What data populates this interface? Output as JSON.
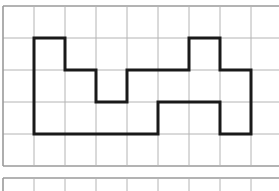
{
  "figure": {
    "colors": {
      "background": "#ffffff",
      "grid_line": "#b4b4b4",
      "grid_border": "#9a9a9a",
      "shape_outline": "#1a1a1a"
    },
    "grid": {
      "origin_x": 3,
      "origin_y": 6,
      "cell_w": 31,
      "cell_h": 32,
      "cols": 9,
      "rows": 5
    },
    "second_grid": {
      "origin_x": 3,
      "origin_y": 178,
      "cell_w": 31,
      "cols": 9
    },
    "shape": {
      "vertices_grid": [
        [
          1,
          1
        ],
        [
          2,
          1
        ],
        [
          2,
          2
        ],
        [
          3,
          2
        ],
        [
          3,
          3
        ],
        [
          4,
          3
        ],
        [
          4,
          2
        ],
        [
          6,
          2
        ],
        [
          6,
          1
        ],
        [
          7,
          1
        ],
        [
          7,
          2
        ],
        [
          8,
          2
        ],
        [
          8,
          4
        ],
        [
          7,
          4
        ],
        [
          7,
          3
        ],
        [
          5,
          3
        ],
        [
          5,
          4
        ],
        [
          1,
          4
        ]
      ]
    }
  }
}
